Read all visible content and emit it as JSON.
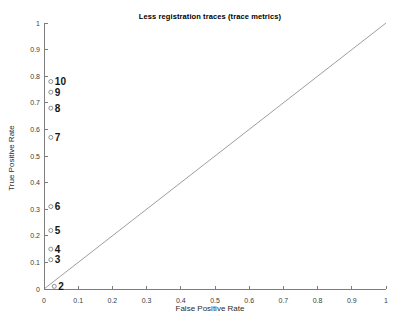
{
  "chart_data": {
    "type": "scatter",
    "title": "Less registration traces (trace metrics)",
    "xlabel": "False Positive Rate",
    "ylabel": "True Positive Rate",
    "xlim": [
      0,
      1
    ],
    "ylim": [
      0,
      1
    ],
    "grid": false,
    "legend": null,
    "xticks": [
      0,
      0.1,
      0.2,
      0.3,
      0.4,
      0.5,
      0.6,
      0.7,
      0.8,
      0.9,
      1
    ],
    "xtick_labels": [
      "0",
      "0.1",
      "0.2",
      "0.3",
      "0.4",
      "0.5",
      "0.6",
      "0.7",
      "0.8",
      "0.9",
      "1"
    ],
    "yticks": [
      0,
      0.1,
      0.2,
      0.3,
      0.4,
      0.5,
      0.6,
      0.7,
      0.8,
      0.9,
      1
    ],
    "ytick_labels": [
      "0",
      "0.1",
      "0.2",
      "0.3",
      "0.4",
      "0.5",
      "0.6",
      "0.7",
      "0.8",
      "0.9",
      "1"
    ],
    "points": [
      {
        "label": "2",
        "x": 0.03,
        "y": 0.01
      },
      {
        "label": "3",
        "x": 0.02,
        "y": 0.11
      },
      {
        "label": "4",
        "x": 0.02,
        "y": 0.15
      },
      {
        "label": "5",
        "x": 0.02,
        "y": 0.22
      },
      {
        "label": "6",
        "x": 0.02,
        "y": 0.31
      },
      {
        "label": "7",
        "x": 0.02,
        "y": 0.57
      },
      {
        "label": "8",
        "x": 0.02,
        "y": 0.68
      },
      {
        "label": "9",
        "x": 0.02,
        "y": 0.74
      },
      {
        "label": "10",
        "x": 0.02,
        "y": 0.78
      }
    ],
    "reference_line": {
      "from": [
        0,
        0
      ],
      "to": [
        1,
        1
      ]
    },
    "marker": {
      "shape": "circle-open",
      "radius": 2
    },
    "colors": {
      "background": "#ffffff",
      "axis": "#7d7d7d",
      "tick_text": "#3c3c3c",
      "reference_line": "#9e9e9e",
      "marker_stroke": "#8f8f8f",
      "marker_label": "#141414"
    }
  }
}
